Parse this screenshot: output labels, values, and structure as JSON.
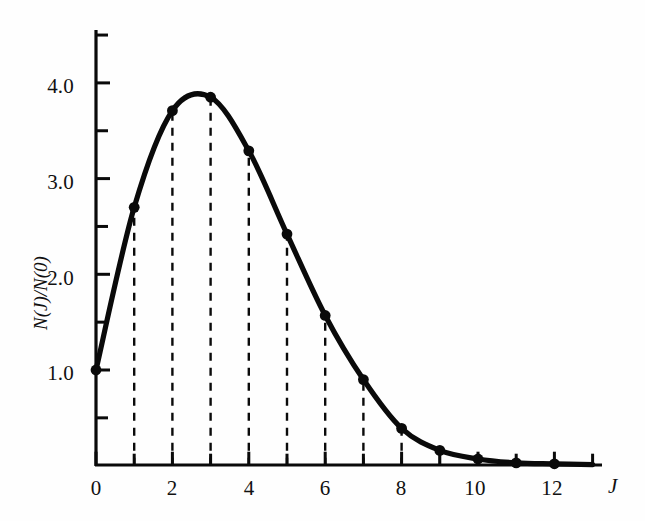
{
  "figure": {
    "background_color": "#fefefe",
    "ink_color": "#0a0a0a"
  },
  "axes": {
    "x_axis_name": "J",
    "y_axis_name": "N(J)/N(0)",
    "x_major_labels": [
      "0",
      "2",
      "4",
      "6",
      "8",
      "10",
      "12"
    ],
    "x_major_values": [
      0,
      2,
      4,
      6,
      8,
      10,
      12
    ],
    "x_minor_values": [
      1,
      3,
      5,
      7,
      9,
      11,
      13
    ],
    "y_major_labels": [
      "1.0",
      "2.0",
      "3.0",
      "4.0"
    ],
    "y_major_values": [
      1.0,
      2.0,
      3.0,
      4.0
    ],
    "y_minor_values": [
      1.5,
      2.5,
      3.5
    ]
  },
  "chart_data": {
    "type": "line",
    "title": "",
    "subtitle": "",
    "xlabel": "J",
    "ylabel": "N(J)/N(0)",
    "x": [
      0,
      1,
      2,
      3,
      4,
      5,
      6,
      7,
      8,
      9,
      10,
      11,
      12
    ],
    "values": [
      1.0,
      2.7,
      3.71,
      3.85,
      3.29,
      2.42,
      1.57,
      0.9,
      0.39,
      0.16,
      0.07,
      0.03,
      0.02
    ],
    "categories": [
      "0",
      "1",
      "2",
      "3",
      "4",
      "5",
      "6",
      "7",
      "8",
      "9",
      "10",
      "11",
      "12"
    ],
    "series": [
      {
        "name": "N(J)/N(0)",
        "values": [
          1.0,
          2.7,
          3.71,
          3.85,
          3.29,
          2.42,
          1.57,
          0.9,
          0.39,
          0.16,
          0.07,
          0.03,
          0.02
        ]
      }
    ],
    "xlim": [
      0,
      13
    ],
    "ylim": [
      0,
      4.5
    ],
    "grid": false,
    "legend": "none",
    "markers": "filled-circle",
    "line_style": "solid-thick-smooth",
    "drop_lines": {
      "style": "dashed",
      "from_baseline": true,
      "at_x": [
        1,
        2,
        3,
        4,
        5,
        6,
        7,
        8
      ]
    },
    "annotations": []
  }
}
